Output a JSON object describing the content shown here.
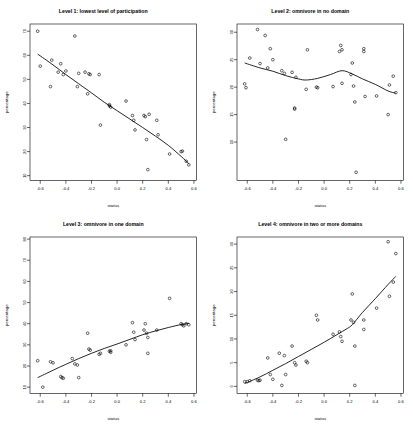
{
  "figure": {
    "layout": "2x2 grid of scatterplots with smoothed trend lines",
    "background": "#ffffff",
    "point_color": "#000000",
    "line_color": "#000000"
  },
  "chart_data": [
    {
      "type": "scatter",
      "title": "Level 1: lowest level of participation",
      "xlabel": "status",
      "ylabel": "percentage",
      "xlim": [
        -0.68,
        0.62
      ],
      "ylim": [
        8,
        73
      ],
      "xticks": [
        -0.6,
        -0.4,
        -0.2,
        0.0,
        0.2,
        0.4,
        0.6
      ],
      "xticklabels": [
        "-0.6",
        "-0.4",
        "-0.2",
        "0.0",
        "0.2",
        "0.4",
        "0.6"
      ],
      "yticks": [
        10,
        20,
        30,
        40,
        50,
        60,
        70
      ],
      "yticklabels": [
        "10",
        "20",
        "30",
        "40",
        "50",
        "60",
        "70"
      ],
      "grid": false,
      "legend": false,
      "x": [
        -0.62,
        -0.6,
        -0.52,
        -0.51,
        -0.46,
        -0.44,
        -0.42,
        -0.4,
        -0.33,
        -0.31,
        -0.3,
        -0.25,
        -0.23,
        -0.22,
        -0.21,
        -0.14,
        -0.13,
        -0.06,
        -0.06,
        -0.05,
        0.07,
        0.12,
        0.13,
        0.14,
        0.21,
        0.22,
        0.23,
        0.24,
        0.25,
        0.31,
        0.32,
        0.41,
        0.5,
        0.51,
        0.54,
        0.56
      ],
      "y": [
        70.0,
        55.5,
        47.0,
        58.0,
        53.0,
        56.5,
        52.0,
        53.5,
        68.0,
        47.0,
        52.5,
        53.0,
        44.0,
        52.3,
        52.0,
        52.0,
        31.0,
        39.5,
        39.0,
        38.5,
        41.0,
        35.0,
        33.0,
        29.0,
        35.0,
        34.5,
        25.0,
        12.5,
        35.5,
        33.0,
        27.0,
        19.0,
        20.0,
        20.2,
        16.0,
        14.5
      ],
      "trend": {
        "name": "smooth",
        "x": [
          -0.62,
          -0.5,
          -0.4,
          -0.3,
          -0.2,
          -0.1,
          0.0,
          0.1,
          0.2,
          0.3,
          0.4,
          0.5,
          0.56
        ],
        "y": [
          60.5,
          56.0,
          52.0,
          48.2,
          44.4,
          40.5,
          37.0,
          33.5,
          30.0,
          26.4,
          22.6,
          18.0,
          15.0
        ]
      }
    },
    {
      "type": "scatter",
      "title": "Level 2: omnivore in no domain",
      "xlabel": "status",
      "ylabel": "percentage",
      "xlim": [
        -0.68,
        0.62
      ],
      "ylim": [
        3,
        31.5
      ],
      "xticks": [
        -0.6,
        -0.4,
        -0.2,
        0.0,
        0.2,
        0.4,
        0.6
      ],
      "xticklabels": [
        "-0.6",
        "-0.4",
        "-0.2",
        "0.0",
        "0.2",
        "0.4",
        "0.6"
      ],
      "yticks": [
        10,
        15,
        20,
        25,
        30
      ],
      "yticklabels": [
        "10",
        "15",
        "20",
        "25",
        "30"
      ],
      "grid": false,
      "legend": false,
      "x": [
        -0.62,
        -0.61,
        -0.58,
        -0.52,
        -0.5,
        -0.46,
        -0.44,
        -0.42,
        -0.4,
        -0.33,
        -0.31,
        -0.3,
        -0.25,
        -0.23,
        -0.23,
        -0.22,
        -0.14,
        -0.13,
        -0.06,
        -0.05,
        0.07,
        0.12,
        0.13,
        0.14,
        0.14,
        0.21,
        0.22,
        0.23,
        0.24,
        0.25,
        0.31,
        0.31,
        0.32,
        0.41,
        0.5,
        0.51,
        0.54,
        0.56
      ],
      "y": [
        20.6,
        19.9,
        25.3,
        30.5,
        24.3,
        29.4,
        23.5,
        27.0,
        25.0,
        23.0,
        22.5,
        10.5,
        22.7,
        16.2,
        16.0,
        21.8,
        19.6,
        26.8,
        20.0,
        19.9,
        20.1,
        26.5,
        27.6,
        26.8,
        20.7,
        22.3,
        24.4,
        20.2,
        17.3,
        4.5,
        26.5,
        27.0,
        18.3,
        18.4,
        15.0,
        20.4,
        22.0,
        19.0
      ],
      "trend": {
        "name": "smooth",
        "x": [
          -0.62,
          -0.5,
          -0.4,
          -0.3,
          -0.2,
          -0.14,
          -0.05,
          0.05,
          0.14,
          0.22,
          0.3,
          0.4,
          0.5,
          0.56
        ],
        "y": [
          24.4,
          23.5,
          22.9,
          22.1,
          21.5,
          21.3,
          21.6,
          22.3,
          23.0,
          22.4,
          21.5,
          20.5,
          19.3,
          18.9
        ]
      }
    },
    {
      "type": "scatter",
      "title": "Level 3: omnivore in one domain",
      "xlabel": "status",
      "ylabel": "percentage",
      "xlim": [
        -0.68,
        0.62
      ],
      "ylim": [
        7,
        81
      ],
      "xticks": [
        -0.6,
        -0.4,
        -0.2,
        0.0,
        0.2,
        0.4,
        0.6
      ],
      "xticklabels": [
        "-0.6",
        "-0.4",
        "-0.2",
        "0.0",
        "0.2",
        "0.4",
        "0.6"
      ],
      "yticks": [
        10,
        20,
        30,
        40,
        50,
        60,
        70,
        80
      ],
      "yticklabels": [
        "10",
        "20",
        "30",
        "40",
        "50",
        "60",
        "70",
        "80"
      ],
      "grid": false,
      "legend": false,
      "x": [
        -0.62,
        -0.58,
        -0.52,
        -0.5,
        -0.44,
        -0.43,
        -0.42,
        -0.35,
        -0.33,
        -0.31,
        -0.3,
        -0.23,
        -0.22,
        -0.21,
        -0.14,
        -0.13,
        -0.06,
        -0.05,
        -0.05,
        0.07,
        0.12,
        0.13,
        0.14,
        0.21,
        0.22,
        0.23,
        0.24,
        0.24,
        0.31,
        0.41,
        0.5,
        0.51,
        0.52,
        0.54,
        0.56
      ],
      "y": [
        22.5,
        10.0,
        22.0,
        21.5,
        15.0,
        14.5,
        14.2,
        23.5,
        21.0,
        20.5,
        14.5,
        35.5,
        28.0,
        27.5,
        25.5,
        26.0,
        27.0,
        27.2,
        26.5,
        30.0,
        40.5,
        36.0,
        32.5,
        37.0,
        40.0,
        35.5,
        33.5,
        26.0,
        37.0,
        52.0,
        40.0,
        39.5,
        39.0,
        40.0,
        39.5
      ],
      "trend": {
        "name": "smooth",
        "x": [
          -0.62,
          -0.5,
          -0.4,
          -0.3,
          -0.2,
          -0.1,
          0.0,
          0.1,
          0.2,
          0.3,
          0.4,
          0.5,
          0.56
        ],
        "y": [
          14.5,
          18.0,
          20.8,
          23.5,
          26.0,
          28.3,
          30.4,
          32.6,
          34.8,
          36.6,
          38.2,
          39.6,
          40.2
        ]
      }
    },
    {
      "type": "scatter",
      "title": "Level 4: omnivore in two or more domains",
      "xlabel": "status",
      "ylabel": "percentage",
      "xlim": [
        -0.68,
        0.62
      ],
      "ylim": [
        -1.5,
        31.5
      ],
      "xticks": [
        -0.6,
        -0.4,
        -0.2,
        0.0,
        0.2,
        0.4,
        0.6
      ],
      "xticklabels": [
        "-0.6",
        "-0.4",
        "-0.2",
        "0.0",
        "0.2",
        "0.4",
        "0.6"
      ],
      "yticks": [
        0,
        5,
        10,
        15,
        20,
        25,
        30
      ],
      "yticklabels": [
        "0",
        "5",
        "10",
        "15",
        "20",
        "25",
        "30"
      ],
      "grid": false,
      "legend": false,
      "x": [
        -0.62,
        -0.6,
        -0.58,
        -0.52,
        -0.51,
        -0.5,
        -0.44,
        -0.42,
        -0.4,
        -0.35,
        -0.33,
        -0.31,
        -0.3,
        -0.25,
        -0.23,
        -0.22,
        -0.14,
        -0.13,
        -0.06,
        -0.05,
        0.07,
        0.12,
        0.13,
        0.14,
        0.21,
        0.22,
        0.23,
        0.24,
        0.24,
        0.31,
        0.31,
        0.41,
        0.5,
        0.51,
        0.54,
        0.56
      ],
      "y": [
        1.0,
        1.0,
        1.2,
        1.3,
        1.2,
        1.3,
        6.0,
        2.5,
        1.5,
        7.0,
        0.2,
        6.5,
        2.5,
        8.5,
        5.0,
        4.5,
        5.3,
        5.0,
        15.0,
        14.0,
        11.0,
        11.5,
        10.5,
        9.5,
        14.0,
        19.5,
        13.5,
        8.5,
        0.2,
        14.0,
        12.0,
        16.5,
        30.5,
        19.0,
        22.0,
        28.0
      ],
      "trend": {
        "name": "smooth",
        "x": [
          -0.62,
          -0.5,
          -0.4,
          -0.3,
          -0.2,
          -0.1,
          0.0,
          0.1,
          0.18,
          0.22,
          0.3,
          0.4,
          0.5,
          0.56
        ],
        "y": [
          0.6,
          2.0,
          3.4,
          4.8,
          6.3,
          7.8,
          9.3,
          10.9,
          12.2,
          13.0,
          15.6,
          18.5,
          21.5,
          23.2
        ]
      }
    }
  ]
}
